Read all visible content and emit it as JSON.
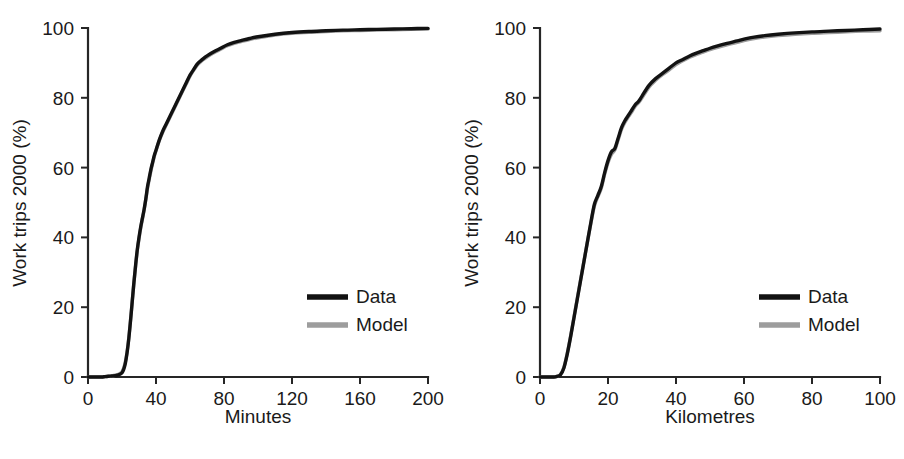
{
  "figure": {
    "background": "#ffffff",
    "panel_count": 2,
    "colors": {
      "data_series": "#121212",
      "model_series": "#9d9d9d",
      "axis": "#262626",
      "text": "#1a1a1a"
    }
  },
  "chart_data": [
    {
      "type": "line",
      "panel": "left",
      "title": "",
      "xlabel": "Minutes",
      "ylabel": "Work trips 2000  (%)",
      "xlim": [
        0,
        200
      ],
      "ylim": [
        0,
        100
      ],
      "xticks": [
        0,
        40,
        80,
        120,
        160,
        200
      ],
      "yticks": [
        0,
        20,
        40,
        60,
        80,
        100
      ],
      "xticklabels": [
        "0",
        "40",
        "80",
        "120",
        "160",
        "200"
      ],
      "yticklabels": [
        "0",
        "20",
        "40",
        "60",
        "80",
        "100"
      ],
      "grid": false,
      "legend": {
        "position": "lower-right",
        "entries": [
          {
            "name": "Data",
            "color": "#121212"
          },
          {
            "name": "Model",
            "color": "#9d9d9d"
          }
        ]
      },
      "x": [
        0,
        2,
        4,
        6,
        8,
        10,
        12,
        14,
        16,
        18,
        20,
        21,
        22,
        23,
        24,
        25,
        26,
        27,
        28,
        29,
        30,
        31,
        32,
        33,
        34,
        35,
        36,
        37,
        38,
        39,
        40,
        42,
        44,
        46,
        48,
        50,
        52,
        54,
        56,
        58,
        60,
        62,
        64,
        66,
        68,
        70,
        74,
        78,
        82,
        86,
        90,
        95,
        100,
        110,
        120,
        130,
        140,
        150,
        160,
        170,
        180,
        190,
        200
      ],
      "series": [
        {
          "name": "Data",
          "color": "#121212",
          "values": [
            0.0,
            0.0,
            0.0,
            0.0,
            0.0,
            0.1,
            0.2,
            0.3,
            0.4,
            0.6,
            1.2,
            2.2,
            4.0,
            7.0,
            11.0,
            16.0,
            21.5,
            27.0,
            32.0,
            36.5,
            40.0,
            43.0,
            45.5,
            48.0,
            51.0,
            54.5,
            57.0,
            59.5,
            61.5,
            63.5,
            65.0,
            68.0,
            70.5,
            72.5,
            74.5,
            76.5,
            78.5,
            80.5,
            82.5,
            84.5,
            86.5,
            88.0,
            89.5,
            90.5,
            91.3,
            92.0,
            93.2,
            94.2,
            95.2,
            95.9,
            96.4,
            97.0,
            97.5,
            98.2,
            98.7,
            99.0,
            99.2,
            99.4,
            99.5,
            99.6,
            99.7,
            99.8,
            99.9
          ]
        },
        {
          "name": "Model",
          "color": "#9d9d9d",
          "values": [
            0.0,
            0.0,
            0.0,
            0.0,
            0.0,
            0.1,
            0.2,
            0.3,
            0.5,
            0.8,
            1.5,
            2.6,
            4.4,
            7.2,
            11.2,
            16.2,
            21.6,
            27.0,
            31.8,
            36.2,
            39.6,
            42.6,
            45.2,
            47.8,
            50.8,
            54.0,
            56.6,
            59.0,
            61.2,
            63.2,
            64.8,
            67.8,
            70.2,
            72.2,
            74.2,
            76.2,
            78.2,
            80.2,
            82.2,
            84.2,
            86.2,
            87.8,
            89.2,
            90.2,
            91.0,
            91.7,
            92.9,
            93.9,
            94.9,
            95.6,
            96.1,
            96.7,
            97.2,
            98.0,
            98.5,
            98.8,
            99.0,
            99.2,
            99.3,
            99.4,
            99.5,
            99.6,
            99.7
          ]
        }
      ]
    },
    {
      "type": "line",
      "panel": "right",
      "title": "",
      "xlabel": "Kilometres",
      "ylabel": "Work trips 2000  (%)",
      "xlim": [
        0,
        100
      ],
      "ylim": [
        0,
        100
      ],
      "xticks": [
        0,
        20,
        40,
        60,
        80,
        100
      ],
      "yticks": [
        0,
        20,
        40,
        60,
        80,
        100
      ],
      "xticklabels": [
        "0",
        "20",
        "40",
        "60",
        "80",
        "100"
      ],
      "yticklabels": [
        "0",
        "20",
        "40",
        "60",
        "80",
        "100"
      ],
      "grid": false,
      "legend": {
        "position": "lower-right",
        "entries": [
          {
            "name": "Data",
            "color": "#121212"
          },
          {
            "name": "Model",
            "color": "#9d9d9d"
          }
        ]
      },
      "x": [
        0,
        1,
        2,
        3,
        4,
        5,
        6,
        7,
        8,
        9,
        10,
        11,
        12,
        13,
        14,
        15,
        16,
        17,
        18,
        19,
        20,
        21,
        22,
        23,
        24,
        25,
        26,
        27,
        28,
        29,
        30,
        32,
        34,
        36,
        38,
        40,
        42,
        44,
        46,
        48,
        50,
        52,
        55,
        58,
        60,
        63,
        66,
        70,
        75,
        80,
        85,
        90,
        95,
        100
      ],
      "series": [
        {
          "name": "Data",
          "color": "#121212",
          "values": [
            0.0,
            0.0,
            0.0,
            0.0,
            0.0,
            0.2,
            0.6,
            2.5,
            6.5,
            11.5,
            17.0,
            22.5,
            28.0,
            33.5,
            39.0,
            44.5,
            49.5,
            52.0,
            54.5,
            58.5,
            62.0,
            64.5,
            65.5,
            68.5,
            71.5,
            73.5,
            75.0,
            76.5,
            78.0,
            79.0,
            80.5,
            83.5,
            85.5,
            87.0,
            88.5,
            90.0,
            91.0,
            92.0,
            92.8,
            93.5,
            94.2,
            94.8,
            95.6,
            96.3,
            96.8,
            97.4,
            97.8,
            98.2,
            98.6,
            98.9,
            99.1,
            99.3,
            99.5,
            99.7
          ]
        },
        {
          "name": "Model",
          "color": "#9d9d9d",
          "values": [
            0.0,
            0.0,
            0.0,
            0.0,
            0.0,
            0.2,
            0.7,
            2.7,
            6.7,
            11.7,
            17.2,
            22.7,
            28.2,
            33.6,
            39.0,
            44.2,
            49.0,
            51.6,
            54.0,
            58.0,
            61.4,
            63.8,
            65.0,
            68.0,
            71.0,
            73.0,
            74.6,
            76.0,
            77.6,
            78.6,
            80.0,
            83.0,
            85.0,
            86.6,
            88.0,
            89.5,
            90.6,
            91.6,
            92.4,
            93.1,
            93.8,
            94.4,
            95.2,
            95.9,
            96.4,
            97.0,
            97.4,
            97.8,
            98.2,
            98.5,
            98.7,
            98.9,
            99.1,
            99.2
          ]
        }
      ]
    }
  ]
}
